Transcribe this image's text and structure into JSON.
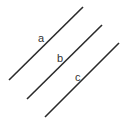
{
  "diagram": {
    "type": "parallel-lines",
    "line_color": "#2a2a2a",
    "lines": [
      {
        "label": "a",
        "x1": 9,
        "y1": 80,
        "x2": 83,
        "y2": 7,
        "lx": 38,
        "ly": 42
      },
      {
        "label": "b",
        "x1": 27,
        "y1": 99,
        "x2": 102,
        "y2": 25,
        "lx": 57,
        "ly": 62
      },
      {
        "label": "c",
        "x1": 45,
        "y1": 117,
        "x2": 119,
        "y2": 43,
        "lx": 75,
        "ly": 81
      }
    ]
  }
}
